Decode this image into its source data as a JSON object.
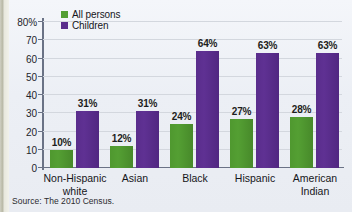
{
  "chart_data": {
    "type": "bar",
    "title": "",
    "xlabel": "",
    "ylabel": "",
    "ylim": [
      0,
      80
    ],
    "grid": true,
    "legend_position": "top-left",
    "categories": [
      "Non-Hispanic\nwhite",
      "Asian",
      "Black",
      "Hispanic",
      "American\nIndian"
    ],
    "series": [
      {
        "name": "All persons",
        "color": "#539e33",
        "values": [
          10,
          12,
          24,
          27,
          28
        ],
        "labels": [
          "10%",
          "12%",
          "24%",
          "27%",
          "28%"
        ]
      },
      {
        "name": "Children",
        "color": "#5a2d8c",
        "values": [
          31,
          31,
          64,
          63,
          63
        ],
        "labels": [
          "31%",
          "31%",
          "64%",
          "63%",
          "63%"
        ]
      }
    ],
    "yticks": [
      0,
      10,
      20,
      30,
      40,
      50,
      60,
      70,
      80
    ],
    "ytick_labels": [
      "0",
      "10",
      "20",
      "30",
      "40",
      "50",
      "60",
      "70",
      "80%"
    ],
    "source": "Source: The 2010 Census."
  },
  "legend": {
    "items": [
      {
        "label": "All persons"
      },
      {
        "label": "Children"
      }
    ]
  },
  "source_note": "Source: The 2010 Census."
}
